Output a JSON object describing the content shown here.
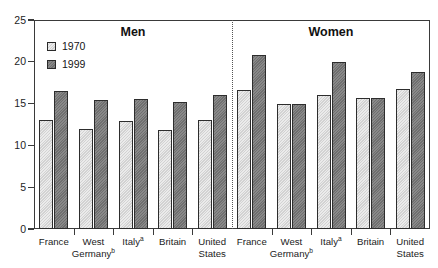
{
  "top_remnant": "",
  "chart_data": {
    "type": "bar",
    "title": "",
    "xlabel": "",
    "ylabel": "",
    "ylim": [
      0,
      25
    ],
    "yticks": [
      0,
      5,
      10,
      15,
      20,
      25
    ],
    "ytick_labels": [
      "0",
      "5",
      "10",
      "15",
      "20",
      "25"
    ],
    "grid": false,
    "legend_position": "upper-left-inside",
    "panels": [
      {
        "name": "Men",
        "label": "Men",
        "categories": [
          "France",
          "West Germany",
          "Italy",
          "Britain",
          "United States"
        ],
        "category_labels": [
          "France",
          "West\nGermany",
          "Italy",
          "Britain",
          "United\nStates"
        ],
        "category_footnotes": [
          "",
          "b",
          "a",
          "",
          ""
        ],
        "series": [
          {
            "name": "1970",
            "values": [
              13.0,
              12.0,
              12.9,
              11.9,
              13.0
            ]
          },
          {
            "name": "1999",
            "values": [
              16.5,
              15.4,
              15.6,
              15.2,
              16.0
            ]
          }
        ]
      },
      {
        "name": "Women",
        "label": "Women",
        "categories": [
          "France",
          "West Germany",
          "Italy",
          "Britain",
          "United States"
        ],
        "category_labels": [
          "France",
          "West\nGermany",
          "Italy",
          "Britain",
          "United\nStates"
        ],
        "category_footnotes": [
          "",
          "b",
          "a",
          "",
          ""
        ],
        "series": [
          {
            "name": "1970",
            "values": [
              16.6,
              14.9,
              16.0,
              15.7,
              16.7
            ]
          },
          {
            "name": "1999",
            "values": [
              20.8,
              14.9,
              20.0,
              15.7,
              18.8
            ]
          }
        ]
      }
    ],
    "legend": [
      {
        "label": "1970",
        "color": "#d2d2d2"
      },
      {
        "label": "1999",
        "color": "#6f6f6f"
      }
    ]
  },
  "colors": {
    "series_1970": "#d2d2d2",
    "series_1999": "#6f6f6f",
    "axis": "#3a3a3a",
    "text": "#1b1b1b",
    "divider": "#555555",
    "background": "#ffffff"
  }
}
